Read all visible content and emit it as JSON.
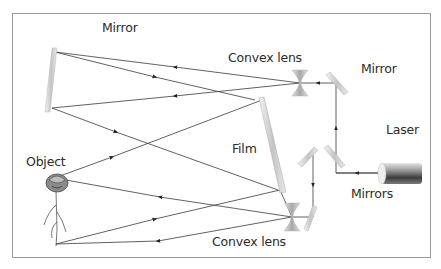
{
  "labels": {
    "mirror_top": "Mirror",
    "convex_lens_top": "Convex lens",
    "mirror_right": "Mirror",
    "laser": "Laser",
    "object": "Object",
    "film": "Film",
    "mirrors": "Mirrors",
    "convex_lens_bottom": "Convex lens"
  },
  "colors": {
    "frame": "#9a9a9a",
    "ray": "#3a3a3a",
    "mirror": "#d8d8d8",
    "lens": "#c8c8c8",
    "laser_body": "#555555"
  }
}
